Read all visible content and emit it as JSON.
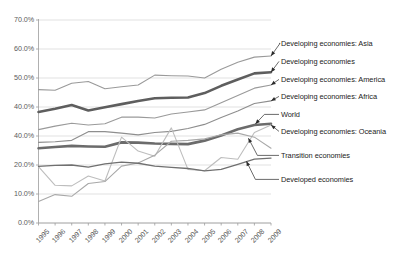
{
  "chart_data": {
    "type": "line",
    "title": "",
    "xlabel": "",
    "ylabel": "",
    "x": [
      "1995",
      "1996",
      "1997",
      "1998",
      "1999",
      "2000",
      "2001",
      "2002",
      "2003",
      "2004",
      "2005",
      "2006",
      "2007",
      "2008",
      "2009"
    ],
    "ylim": [
      0,
      70
    ],
    "ytick_labels": [
      "70.0%",
      "60.0%",
      "50.0%",
      "40.0%",
      "40.0%",
      "20.0%",
      "10.0%",
      "0.0%"
    ],
    "ytick_values": [
      70,
      60,
      50,
      40,
      30,
      20,
      10,
      0
    ],
    "grid": true,
    "legend_position": "right-callouts",
    "series": [
      {
        "name": "Developing economies: Asia",
        "color": "#9a9a9a",
        "width": 1.1,
        "values": [
          46.0,
          45.8,
          48.2,
          48.8,
          46.3,
          47.0,
          47.6,
          51.0,
          50.8,
          50.7,
          50.0,
          53.0,
          55.4,
          57.2,
          57.6
        ]
      },
      {
        "name": "Developing economies",
        "color": "#5e5e5e",
        "width": 2.6,
        "values": [
          38.3,
          39.4,
          40.7,
          38.8,
          39.9,
          41.0,
          42.1,
          43.0,
          43.2,
          43.3,
          44.8,
          47.3,
          49.5,
          51.6,
          52.0
        ]
      },
      {
        "name": "Developing economies: America",
        "color": "#9a9a9a",
        "width": 1.1,
        "values": [
          32.2,
          33.4,
          34.4,
          33.8,
          34.2,
          36.5,
          36.5,
          36.2,
          37.6,
          38.3,
          39.0,
          41.5,
          44.0,
          46.5,
          47.6
        ]
      },
      {
        "name": "Developing economies: Africa",
        "color": "#8e8e8e",
        "width": 1.1,
        "values": [
          27.8,
          28.0,
          28.5,
          31.5,
          31.5,
          31.0,
          30.4,
          31.2,
          31.6,
          32.6,
          34.0,
          36.4,
          38.6,
          41.2,
          42.1
        ]
      },
      {
        "name": "World",
        "color": "#6b6b6b",
        "width": 2.6,
        "values": [
          25.8,
          26.2,
          26.6,
          26.4,
          26.3,
          27.8,
          27.7,
          27.4,
          27.3,
          27.2,
          28.4,
          30.2,
          32.3,
          33.8,
          34.2
        ]
      },
      {
        "name": "Developing economies: Oceania",
        "color": "#bdbdbd",
        "width": 1.1,
        "values": [
          19.4,
          13.0,
          12.8,
          16.2,
          14.5,
          29.6,
          24.8,
          23.0,
          32.8,
          18.5,
          18.0,
          22.6,
          22.0,
          31.2,
          33.8
        ]
      },
      {
        "name": "Transition economies",
        "color": "#a8a8a8",
        "width": 1.1,
        "values": [
          7.4,
          9.8,
          9.2,
          13.6,
          14.3,
          19.6,
          20.7,
          23.4,
          28.2,
          28.5,
          29.0,
          30.4,
          31.0,
          29.6,
          25.8
        ]
      },
      {
        "name": "Developed economies",
        "color": "#707070",
        "width": 1.3,
        "values": [
          19.5,
          19.9,
          20.0,
          19.3,
          20.4,
          21.0,
          20.6,
          19.6,
          19.2,
          18.8,
          18.0,
          18.5,
          20.2,
          22.0,
          22.4
        ]
      }
    ]
  },
  "callouts": [
    {
      "label": "Developing economies: Asia"
    },
    {
      "label": "Developing economies"
    },
    {
      "label": "Developing economies: America"
    },
    {
      "label": "Developing economies: Africa"
    },
    {
      "label": "World"
    },
    {
      "label": "Developing economies: Oceania"
    },
    {
      "label": "Transition economies"
    },
    {
      "label": "Developed economies"
    }
  ]
}
